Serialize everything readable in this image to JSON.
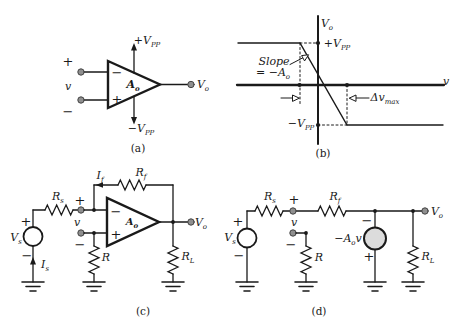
{
  "figure": {
    "captions": {
      "a": "(a)",
      "b": "(b)",
      "c": "(c)",
      "d": "(d)"
    }
  },
  "colors": {
    "line": "#1a1a1a",
    "terminal_fill": "#8f8f8f",
    "dependent_source_fill": "#dcdcdc",
    "background": "#ffffff"
  },
  "labels": {
    "a_supply_pos": {
      "prefix": "+",
      "base": "V",
      "sub": "PP"
    },
    "a_supply_neg": {
      "prefix": "−",
      "base": "V",
      "sub": "PP"
    },
    "a_in_plus": {
      "text": "+"
    },
    "a_in_v": {
      "base": "v"
    },
    "a_in_minus": {
      "text": "−"
    },
    "a_op_minus": {
      "text": "−"
    },
    "a_op_plus": {
      "text": "+"
    },
    "a_gain": {
      "base": "A",
      "sub": "o"
    },
    "a_out": {
      "base": "V",
      "sub": "o"
    },
    "b_yaxis": {
      "base": "V",
      "sub": "o"
    },
    "b_xaxis": {
      "base": "v"
    },
    "b_sat_pos": {
      "prefix": "+",
      "base": "V",
      "sub": "PP"
    },
    "b_sat_neg": {
      "prefix": "−",
      "base": "V",
      "sub": "PP"
    },
    "b_slope1": {
      "base": "Slope"
    },
    "b_slope2": {
      "prefix": "= −",
      "base": "A",
      "sub": "o"
    },
    "b_delta": {
      "base": "Δv",
      "sub": "max"
    },
    "c_source": {
      "base": "V",
      "sub": "s"
    },
    "c_source_plus": {
      "text": "+"
    },
    "c_source_minus": {
      "text": "−"
    },
    "c_is": {
      "base": "I",
      "sub": "s"
    },
    "c_rs": {
      "base": "R",
      "sub": "s"
    },
    "c_if": {
      "base": "I",
      "sub": "f"
    },
    "c_rf": {
      "base": "R",
      "sub": "f"
    },
    "c_in_plus": {
      "text": "+"
    },
    "c_in_v": {
      "base": "v"
    },
    "c_in_minus": {
      "text": "−"
    },
    "c_op_minus": {
      "text": "−"
    },
    "c_op_plus": {
      "text": "+"
    },
    "c_gain": {
      "base": "A",
      "sub": "o"
    },
    "c_out": {
      "base": "V",
      "sub": "o"
    },
    "c_r": {
      "base": "R"
    },
    "c_rl": {
      "base": "R",
      "sub": "L"
    },
    "d_source": {
      "base": "V",
      "sub": "s"
    },
    "d_source_plus": {
      "text": "+"
    },
    "d_source_minus": {
      "text": "−"
    },
    "d_rs": {
      "base": "R",
      "sub": "s"
    },
    "d_rf": {
      "base": "R",
      "sub": "f"
    },
    "d_in_plus": {
      "text": "+"
    },
    "d_in_v": {
      "base": "v"
    },
    "d_in_minus": {
      "text": "−"
    },
    "d_r": {
      "base": "R"
    },
    "d_dep_minus": {
      "text": "−"
    },
    "d_dep_plus": {
      "text": "+"
    },
    "d_dep": {
      "prefix": "−",
      "base": "A",
      "sub": "o",
      "suffix": "v"
    },
    "d_out": {
      "base": "V",
      "sub": "o"
    },
    "d_rl": {
      "base": "R",
      "sub": "L"
    }
  }
}
